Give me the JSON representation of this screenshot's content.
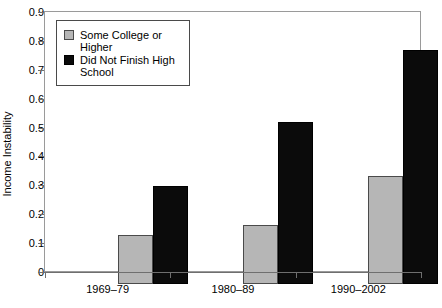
{
  "chart_data": {
    "type": "bar",
    "title": "",
    "subtitle": "",
    "xlabel": "",
    "ylabel": "Income Instability",
    "ylim": [
      0,
      0.9
    ],
    "yticks": [
      "0",
      "0.1",
      "0.2",
      "0.3",
      "0.4",
      "0.5",
      "0.6",
      "0.7",
      "0.8",
      "0.9"
    ],
    "ytick_values": [
      0,
      0.1,
      0.2,
      0.3,
      0.4,
      0.5,
      0.6,
      0.7,
      0.8,
      0.9
    ],
    "grid": false,
    "legend_position": "upper-left-inside",
    "categories": [
      "1969–79",
      "1980–89",
      "1990–2002"
    ],
    "series": [
      {
        "name": "Some College or Higher",
        "color": "#b6b6b6",
        "values": [
          0.17,
          0.205,
          0.375
        ]
      },
      {
        "name": "Did Not Finish High School",
        "color": "#0b0b0b",
        "values": [
          0.34,
          0.56,
          0.81
        ]
      }
    ],
    "annotations": []
  },
  "legend": {
    "items": [
      {
        "label": "Some College or Higher",
        "swatch": "gray"
      },
      {
        "label": "Did Not Finish High School",
        "swatch": "black"
      }
    ]
  }
}
